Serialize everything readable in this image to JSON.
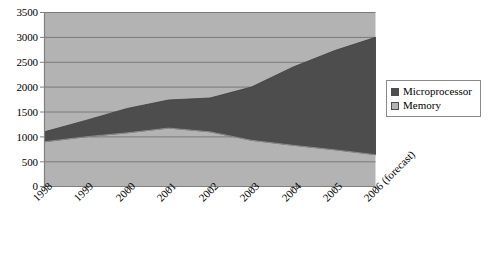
{
  "chart_data": {
    "type": "area",
    "stacked": true,
    "title": "",
    "subtitle": "",
    "xlabel": "",
    "ylabel": "",
    "categories": [
      "1998",
      "1999",
      "2000",
      "2001",
      "2002",
      "2003",
      "2004",
      "2005",
      "2006 (forecast)"
    ],
    "series": [
      {
        "name": "Memory",
        "color": "#b3b3b3",
        "values": [
          900,
          1000,
          1080,
          1175,
          1100,
          930,
          830,
          740,
          640
        ]
      },
      {
        "name": "Microprocessor",
        "color": "#4d4d4d",
        "values": [
          200,
          330,
          490,
          565,
          680,
          1070,
          1570,
          1990,
          2360
        ]
      }
    ],
    "stack_totals": [
      1100,
      1330,
      1570,
      1740,
      1780,
      2000,
      2400,
      2730,
      3000
    ],
    "ylim": [
      0,
      3500
    ],
    "ytick_values": [
      0,
      500,
      1000,
      1500,
      2000,
      2500,
      3000,
      3500
    ],
    "ytick_labels": [
      "0",
      "500",
      "1000",
      "1500",
      "2000",
      "2500",
      "3000",
      "3500"
    ],
    "grid": true,
    "grid_axis": "y",
    "legend_position": "right",
    "legend_entries": [
      {
        "label": "Microprocessor",
        "swatch_color": "#4d4d4d"
      },
      {
        "label": "Memory",
        "swatch_color": "#b3b3b3"
      }
    ],
    "colors": {
      "plot_background": "#b3b3b3",
      "memory_area": "#b3b3b3",
      "microprocessor_area": "#4d4d4d",
      "gridline": "#7a7a7a",
      "axis_line": "#808080",
      "legend_border": "#8a8a8a",
      "page_background": "#ffffff"
    }
  }
}
